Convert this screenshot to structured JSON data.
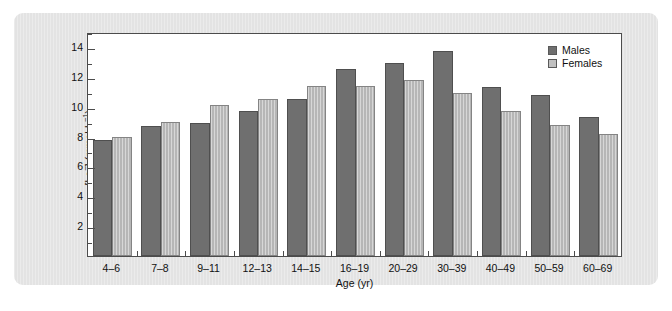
{
  "chart_data": {
    "type": "bar",
    "title": "",
    "xlabel": "Age (yr)",
    "ylabel": "[La−] (mmol·L−1)",
    "categories": [
      "4–6",
      "7–8",
      "9–11",
      "12–13",
      "14–15",
      "16–19",
      "20–29",
      "30–39",
      "40–49",
      "50–59",
      "60–69"
    ],
    "series": [
      {
        "name": "Males",
        "color": "#6f6f6f",
        "values": [
          7.8,
          8.7,
          8.9,
          9.7,
          10.5,
          12.5,
          12.9,
          13.7,
          11.3,
          10.8,
          9.3
        ]
      },
      {
        "name": "Females",
        "color": "#b6b6b6",
        "values": [
          8.0,
          9.0,
          10.1,
          10.5,
          11.4,
          11.4,
          11.8,
          10.9,
          9.7,
          8.8,
          8.2
        ]
      }
    ],
    "ylim": [
      0,
      15
    ],
    "ytick_values": [
      2,
      4,
      6,
      8,
      10,
      12,
      14
    ],
    "ytick_labels": [
      "2",
      "4",
      "6",
      "8",
      "10",
      "12",
      "14"
    ],
    "yminor_values": [
      1,
      3,
      5,
      7,
      9,
      11,
      13,
      15
    ],
    "grid": false,
    "legend_position": "top-right"
  },
  "legend": {
    "items": [
      {
        "label": "Males",
        "swatch": "male-swatch"
      },
      {
        "label": "Females",
        "swatch": "female-swatch"
      }
    ]
  },
  "axis": {
    "y_title_main": "[La",
    "y_title_sup1": "−",
    "y_title_mid": "] (mmol·L",
    "y_title_sup2": "−1",
    "y_title_end": ")",
    "x_title": "Age (yr)"
  }
}
